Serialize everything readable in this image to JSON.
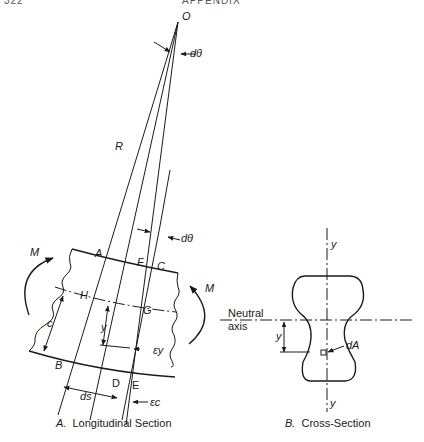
{
  "header": {
    "page_number": "322",
    "title": "APPENDIX"
  },
  "figure_a": {
    "caption_prefix": "A.",
    "caption": "Longitudinal Section",
    "labels": {
      "origin": "O",
      "dtheta_top": "dθ",
      "radius": "R",
      "dtheta_mid": "dθ",
      "moment_left": "M",
      "moment_right": "M",
      "point_a": "A",
      "point_f": "F",
      "point_c": "C",
      "point_h": "H",
      "point_g": "G",
      "point_b": "B",
      "point_d": "D",
      "point_e": "E",
      "dist_c": "c",
      "dist_y": "y",
      "strain_y": "εy",
      "strain_c": "εc",
      "arc_ds": "ds"
    }
  },
  "figure_b": {
    "caption_prefix": "B.",
    "caption": "Cross-Section",
    "labels": {
      "axis_top": "y",
      "axis_bottom": "y",
      "neutral_line1": "Neutral",
      "neutral_line2": "axis",
      "dist_y": "y",
      "area_element": "dA"
    }
  }
}
